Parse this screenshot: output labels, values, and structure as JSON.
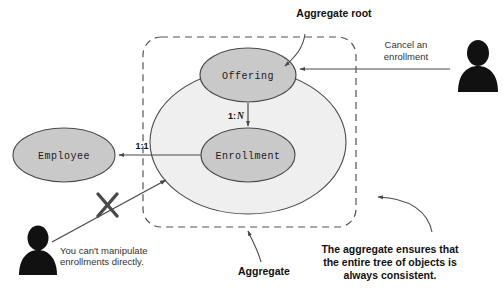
{
  "diagram": {
    "title_text": "Aggregate root",
    "nodes": {
      "offering": {
        "label": "Offering",
        "fill": "#c9c9c9",
        "stroke": "#4a4a4a"
      },
      "enrollment": {
        "label": "Enrollment",
        "fill": "#c9c9c9",
        "stroke": "#4a4a4a"
      },
      "employee": {
        "label": "Employee",
        "fill": "#c9c9c9",
        "stroke": "#4a4a4a"
      },
      "aggregate_blob": {
        "fill": "#efefef",
        "stroke": "#4a4a4a"
      },
      "aggregate_boundary": {
        "stroke": "#555555",
        "style": "dashed"
      }
    },
    "relations": {
      "offering_to_enrollment": {
        "prefix": "1:",
        "multiplicity": "N"
      },
      "enrollment_to_employee": {
        "label": "1:1"
      }
    },
    "annotations": {
      "aggregate_root": "Aggregate root",
      "cancel_enrollment_line1": "Cancel an",
      "cancel_enrollment_line2": "enrollment",
      "aggregate": "Aggregate",
      "no_manipulate_line1": "You can't manipulate",
      "no_manipulate_line2": "enrollments directly.",
      "consistency_line1": "The aggregate ensures that",
      "consistency_line2": "the entire tree of objects is",
      "consistency_line3": "always consistent."
    },
    "actors": {
      "right_user": "user-silhouette",
      "left_user": "user-silhouette"
    },
    "forbidden_marker": "x-cross-mark",
    "colors": {
      "ink": "#1a1a1a",
      "line": "#555555",
      "node_fill": "#c9c9c9",
      "blob_fill": "#efefef",
      "actor_fill": "#111111"
    }
  }
}
